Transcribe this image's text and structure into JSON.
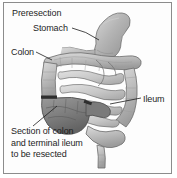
{
  "figure": {
    "title": "Preresection",
    "type": "medical-illustration",
    "background_color": "#ffffff",
    "border_color": "#8c8c8c",
    "text_color": "#1d1d1d"
  },
  "labels": {
    "title": "Preresection",
    "stomach": "Stomach",
    "colon": "Colon",
    "ileum": "Ileum",
    "resected_line1": "Section of colon",
    "resected_line2": "and terminal ileum",
    "resected_line3": "to be resected",
    "resected_full": "Section of colon and terminal ileum to be resected"
  },
  "anatomy": {
    "organs": [
      {
        "name": "stomach",
        "shade": "#b9b9b9"
      },
      {
        "name": "transverse-colon",
        "shade": "#c2c2c2"
      },
      {
        "name": "ascending-colon",
        "shade": "#bdbdbd"
      },
      {
        "name": "descending-colon",
        "shade": "#bdbdbd"
      },
      {
        "name": "sigmoid-colon",
        "shade": "#c4c4c4"
      },
      {
        "name": "small-intestine",
        "shade": "#cfcfcf"
      },
      {
        "name": "cecum-resection-zone",
        "shade": "#8e8e8e"
      },
      {
        "name": "transection-band",
        "shade": "#3a3a3a"
      }
    ]
  }
}
